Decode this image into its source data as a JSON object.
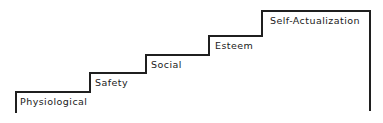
{
  "figure": {
    "kind": "staircase-diagram",
    "background_color": "#ffffff",
    "line_color": "#1f1f1f",
    "line_width": 2,
    "text_color": "#1a1a1a"
  },
  "chart_data": {
    "type": "bar",
    "title": "",
    "subtitle": "",
    "xlabel": "",
    "ylabel": "",
    "grid": false,
    "legend": null,
    "categories": [
      "Physiological",
      "Safety",
      "Social",
      "Esteem",
      "Self-Actualization"
    ],
    "values": [
      1,
      2,
      3,
      4,
      5
    ],
    "xlim": [
      0,
      383
    ],
    "ylim": [
      0,
      123
    ]
  },
  "steps": [
    {
      "id": "physiological",
      "label": "Physiological",
      "level": 1,
      "label_x": 20,
      "label_y": 97,
      "riser_x": 16,
      "tread_y": 92,
      "tread_end_x": 90
    },
    {
      "id": "safety",
      "label": "Safety",
      "level": 2,
      "label_x": 95,
      "label_y": 78,
      "riser_x": 90,
      "tread_y": 73,
      "tread_end_x": 146
    },
    {
      "id": "social",
      "label": "Social",
      "level": 3,
      "label_x": 151,
      "label_y": 60,
      "riser_x": 146,
      "tread_y": 55,
      "tread_end_x": 209
    },
    {
      "id": "esteem",
      "label": "Esteem",
      "level": 4,
      "label_x": 215,
      "label_y": 41,
      "riser_x": 209,
      "tread_y": 36,
      "tread_end_x": 262
    },
    {
      "id": "self-actualization",
      "label": "Self-Actualization",
      "level": 5,
      "label_x": 270,
      "label_y": 16,
      "riser_x": 262,
      "tread_y": 11,
      "tread_end_x": 370
    }
  ],
  "outline": {
    "path": "M 16,112 L 16,92 L 90,92 L 90,73 L 146,73 L 146,55 L 209,55 L 209,36 L 262,36 L 262,11 L 370,11 L 370,110",
    "start_point": [
      16,
      112
    ],
    "end_point": [
      370,
      110
    ]
  }
}
